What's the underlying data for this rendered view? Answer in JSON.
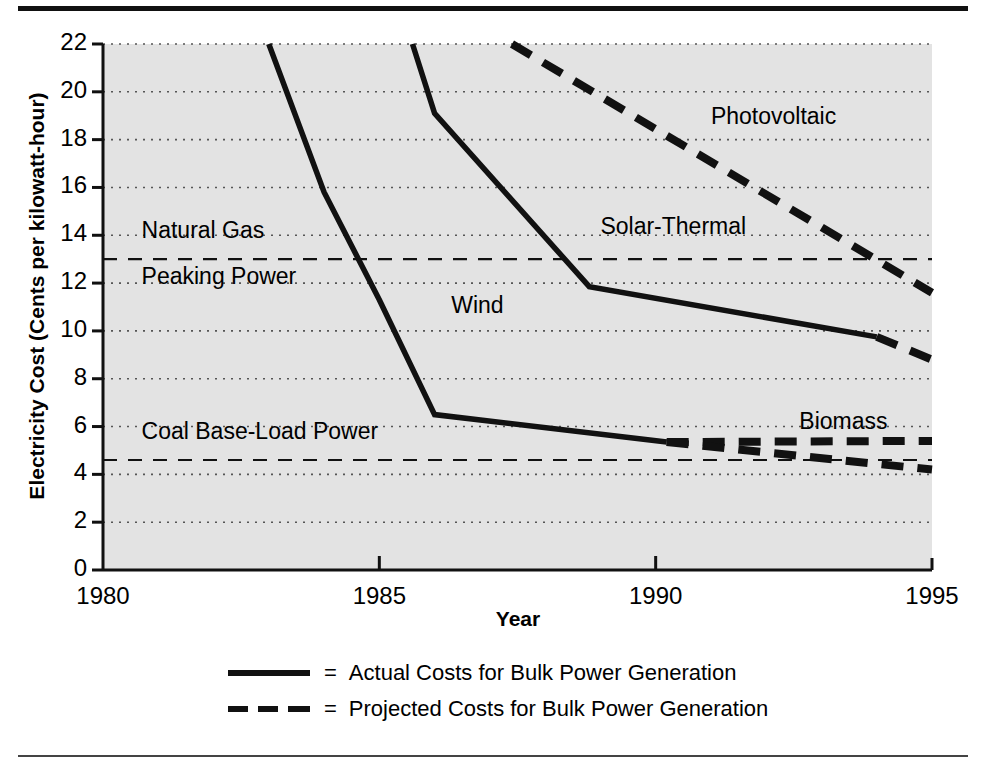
{
  "chart_data": {
    "type": "line",
    "title": "",
    "xlabel": "Year",
    "ylabel": "Electricity Cost (Cents per kilowatt-hour)",
    "xlim": [
      1980,
      1995
    ],
    "ylim": [
      0,
      22
    ],
    "xticks": [
      "1980",
      "1985",
      "1990",
      "1995"
    ],
    "yticks": [
      "0",
      "2",
      "4",
      "6",
      "8",
      "10",
      "12",
      "14",
      "16",
      "18",
      "20",
      "22"
    ],
    "grid": "horizontal-dotted",
    "legend_position": "below-plot",
    "plot_background": "#e3e3e3",
    "line_color": "#111111",
    "series": [
      {
        "name": "Wind",
        "style": "solid",
        "label_x": 1986.3,
        "label_y": 11.0,
        "points": [
          {
            "x": 1983.0,
            "y": 22.0
          },
          {
            "x": 1984.0,
            "y": 15.8
          },
          {
            "x": 1985.0,
            "y": 11.3
          },
          {
            "x": 1986.0,
            "y": 6.5
          },
          {
            "x": 1990.2,
            "y": 5.35
          }
        ]
      },
      {
        "name": "Solar-Thermal",
        "style": "solid",
        "label_x": 1989.0,
        "label_y": 14.3,
        "points": [
          {
            "x": 1985.6,
            "y": 22.0
          },
          {
            "x": 1986.0,
            "y": 19.1
          },
          {
            "x": 1988.8,
            "y": 11.85
          },
          {
            "x": 1994.0,
            "y": 9.75
          }
        ]
      },
      {
        "name": "Solar-Thermal (projected)",
        "style": "dashed",
        "points": [
          {
            "x": 1994.0,
            "y": 9.75
          },
          {
            "x": 1995.0,
            "y": 8.8
          }
        ]
      },
      {
        "name": "Photovoltaic",
        "style": "dashed",
        "label_x": 1991.0,
        "label_y": 18.9,
        "points": [
          {
            "x": 1987.4,
            "y": 22.0
          },
          {
            "x": 1995.0,
            "y": 11.6
          }
        ]
      },
      {
        "name": "Biomass (upper projection)",
        "style": "dashed",
        "label_x": 1992.6,
        "label_y": 6.15,
        "points": [
          {
            "x": 1990.2,
            "y": 5.35
          },
          {
            "x": 1995.0,
            "y": 5.4
          }
        ]
      },
      {
        "name": "Biomass (lower projection)",
        "style": "dashed",
        "points": [
          {
            "x": 1990.2,
            "y": 5.35
          },
          {
            "x": 1995.0,
            "y": 4.2
          }
        ]
      }
    ],
    "reference_lines": [
      {
        "name": "Natural Gas Peaking Power",
        "style": "dashed-thin",
        "y": 13.0,
        "label_lines": [
          "Natural Gas",
          "Peaking Power"
        ],
        "label_x": 1980.3
      },
      {
        "name": "Coal Base-Load Power",
        "style": "dashed-thin",
        "y": 4.6,
        "label_lines": [
          "Coal Base-Load Power"
        ],
        "label_x": 1980.3
      }
    ]
  },
  "legend": {
    "rows": [
      {
        "style": "solid",
        "equals": "=",
        "text": "Actual Costs for Bulk Power Generation"
      },
      {
        "style": "dashed",
        "equals": "=",
        "text": "Projected Costs for Bulk Power Generation"
      }
    ]
  }
}
